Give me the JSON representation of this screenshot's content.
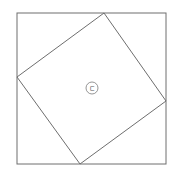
{
  "figure": {
    "colors": {
      "stroke": "#6e6e6e",
      "background": "#ffffff",
      "label": "#555555"
    },
    "outer_square": {
      "x": 17,
      "y": 13,
      "width": 149,
      "height": 151
    },
    "inner_square": {
      "points": "104,13 166,101 80,164 17,77"
    },
    "center_label": {
      "text": "ㄷ",
      "cx": 92,
      "cy": 88,
      "r": 6
    }
  }
}
